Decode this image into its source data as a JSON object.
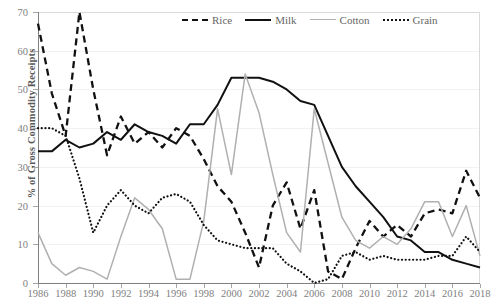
{
  "chart_data": {
    "type": "line",
    "title": "",
    "xlabel": "",
    "ylabel": "% of Gross Commodity Receipts",
    "xlim": [
      1986,
      2018
    ],
    "ylim": [
      0,
      70
    ],
    "ytick_values": [
      0,
      10,
      20,
      30,
      40,
      50,
      60,
      70
    ],
    "ytick_labels": [
      "0",
      "10",
      "20",
      "30",
      "40",
      "50",
      "60",
      "70"
    ],
    "xtick_values": [
      1986,
      1988,
      1990,
      1992,
      1994,
      1996,
      1998,
      2000,
      2002,
      2004,
      2006,
      2008,
      2010,
      2012,
      2014,
      2016,
      2018
    ],
    "xtick_labels": [
      "1986",
      "1988",
      "1990",
      "1992",
      "1994",
      "1996",
      "1998",
      "2000",
      "2002",
      "2004",
      "2006",
      "2008",
      "2010",
      "2012",
      "2014",
      "2016",
      "2018"
    ],
    "grid": "horizontal-faint",
    "legend_position": "top-center",
    "x": [
      1986,
      1987,
      1988,
      1989,
      1990,
      1991,
      1992,
      1993,
      1994,
      1995,
      1996,
      1997,
      1998,
      1999,
      2000,
      2001,
      2002,
      2003,
      2004,
      2005,
      2006,
      2007,
      2008,
      2009,
      2010,
      2011,
      2012,
      2013,
      2014,
      2015,
      2016,
      2017,
      2018
    ],
    "series": [
      {
        "name": "Rice",
        "style": "dashed",
        "color": "#111111",
        "values": [
          67,
          49,
          38,
          70,
          50,
          33,
          43,
          36,
          39,
          35,
          40,
          38,
          32,
          25,
          21,
          13,
          4,
          20,
          26,
          14,
          24,
          3,
          1,
          9,
          16,
          12,
          15,
          12,
          18,
          19,
          18,
          29,
          22
        ]
      },
      {
        "name": "Milk",
        "style": "solid",
        "color": "#111111",
        "values": [
          34,
          34,
          37,
          35,
          36,
          39,
          37,
          41,
          39,
          38,
          36,
          41,
          41,
          46,
          53,
          53,
          53,
          52,
          50,
          47,
          46,
          38,
          30,
          25,
          21,
          17,
          12,
          11,
          8,
          8,
          6,
          5,
          4
        ]
      },
      {
        "name": "Cotton",
        "style": "solid",
        "color": "#b0b0b0",
        "values": [
          13,
          5,
          2,
          4,
          3,
          1,
          12,
          22,
          19,
          14,
          1,
          1,
          16,
          45,
          28,
          54,
          44,
          28,
          13,
          8,
          45,
          31,
          17,
          11,
          9,
          12,
          10,
          14,
          21,
          21,
          12,
          20,
          7
        ]
      },
      {
        "name": "Grain",
        "style": "dotted",
        "color": "#111111",
        "values": [
          40,
          40,
          38,
          27,
          13,
          20,
          24,
          20,
          18,
          22,
          23,
          21,
          15,
          11,
          10,
          9,
          9,
          9,
          5,
          3,
          0,
          1,
          7,
          8,
          6,
          7,
          6,
          6,
          6,
          7,
          7,
          12,
          8
        ]
      }
    ]
  },
  "legend": {
    "items": [
      {
        "label": "Rice",
        "icon": "dashed-line-icon"
      },
      {
        "label": "Milk",
        "icon": "solid-line-icon"
      },
      {
        "label": "Cotton",
        "icon": "gray-solid-line-icon"
      },
      {
        "label": "Grain",
        "icon": "dotted-line-icon"
      }
    ]
  },
  "axis": {
    "y_title": "% of Gross Commodity Receipts"
  }
}
